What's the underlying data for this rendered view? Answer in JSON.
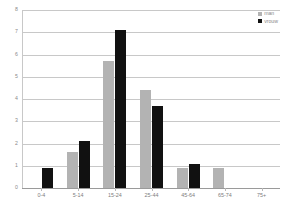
{
  "chart_data": {
    "type": "bar",
    "title": "",
    "subtitle": "",
    "xlabel": "",
    "ylabel": "",
    "categories": [
      "0-4",
      "5-14",
      "15-24",
      "25-44",
      "45-64",
      "65-74",
      "75+"
    ],
    "series": [
      {
        "name": "man",
        "color": "#b3b3b3",
        "values": [
          0,
          1.6,
          5.7,
          4.4,
          0.9,
          0.9,
          0
        ]
      },
      {
        "name": "vrouw",
        "color": "#111111",
        "values": [
          0.9,
          2.1,
          7.1,
          3.7,
          1.1,
          0,
          0
        ]
      }
    ],
    "ylim": [
      0,
      8
    ],
    "yticks": [
      0,
      1,
      2,
      3,
      4,
      5,
      6,
      7,
      8
    ],
    "ytick_labels": [
      "0",
      "1",
      "2",
      "3",
      "4",
      "5",
      "6",
      "7",
      "8"
    ],
    "grid": true,
    "legend_position": "top-right"
  },
  "colors": {
    "grid": "#c8c8c8",
    "axis_text": "#8a8a8a",
    "background": "#ffffff"
  }
}
